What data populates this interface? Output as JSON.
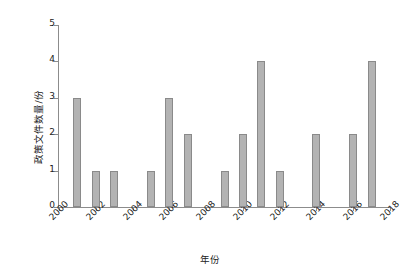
{
  "chart_data": {
    "type": "bar",
    "title": "",
    "xlabel": "年份",
    "ylabel": "政策文件数量/份",
    "xlim": [
      2000,
      2018
    ],
    "ylim": [
      0,
      5
    ],
    "grid": false,
    "legend": false,
    "y_ticks": [
      "0",
      "1",
      "2",
      "3",
      "4",
      "5"
    ],
    "y_tick_values": [
      0,
      1,
      2,
      3,
      4,
      5
    ],
    "x_ticks": [
      "2000",
      "2002",
      "2004",
      "2006",
      "2008",
      "2010",
      "2012",
      "2014",
      "2016",
      "2018"
    ],
    "x_tick_values": [
      2000,
      2002,
      2004,
      2006,
      2008,
      2010,
      2012,
      2014,
      2016,
      2018
    ],
    "categories": [
      2001,
      2002,
      2003,
      2005,
      2006,
      2007,
      2009,
      2010,
      2011,
      2012,
      2014,
      2016,
      2017
    ],
    "values": [
      3,
      1,
      1,
      1,
      3,
      2,
      1,
      2,
      4,
      1,
      2,
      2,
      4
    ],
    "bars": [
      {
        "year": 2001,
        "value": 3
      },
      {
        "year": 2002,
        "value": 1
      },
      {
        "year": 2003,
        "value": 1
      },
      {
        "year": 2005,
        "value": 1
      },
      {
        "year": 2006,
        "value": 3
      },
      {
        "year": 2007,
        "value": 2
      },
      {
        "year": 2009,
        "value": 1
      },
      {
        "year": 2010,
        "value": 2
      },
      {
        "year": 2011,
        "value": 4
      },
      {
        "year": 2012,
        "value": 1
      },
      {
        "year": 2014,
        "value": 2
      },
      {
        "year": 2016,
        "value": 2
      },
      {
        "year": 2017,
        "value": 4
      }
    ],
    "colors": {
      "bar_fill": "#b3b3b3",
      "bar_stroke": "#8a8a8a",
      "axis": "#8c8c8c",
      "text": "#222222",
      "background": "#ffffff"
    }
  }
}
